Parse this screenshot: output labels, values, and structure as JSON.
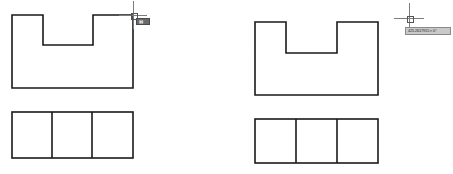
{
  "app": {
    "background_color": "#ffffff",
    "line_color": "#1a1a1a",
    "crosshair_color": "#7d7d7d"
  },
  "panels": [
    {
      "id": "left",
      "name": "left-drawing-panel",
      "front_view": {
        "name": "u-shaped-profile",
        "label": "U-shaped notched rectangle",
        "outline_points": "12,15 12,88 133,88 133,15 93,15 93,45 43,45 43,15",
        "bounds": {
          "x": 12,
          "y": 15,
          "width": 121,
          "height": 73
        },
        "notch": {
          "x": 43,
          "y": 15,
          "width": 50,
          "height": 30
        }
      },
      "top_view": {
        "name": "three-cell-rectangle",
        "label": "Rectangle divided into three cells",
        "bounds": {
          "x": 12,
          "y": 112,
          "width": 121,
          "height": 46
        },
        "dividers_x": [
          52,
          92
        ]
      },
      "cursor": {
        "name": "crosshair-cursor",
        "x": 133,
        "y": 15,
        "arm_length": 14,
        "pickbox_size": 5
      },
      "tooltip": {
        "name": "dynamic-input-tooltip",
        "style": "dark",
        "x": 136,
        "y": 18,
        "width": 14,
        "height": 7,
        "text": "▮▮"
      }
    },
    {
      "id": "right",
      "name": "right-drawing-panel",
      "front_view": {
        "name": "u-shaped-profile",
        "label": "U-shaped notched rectangle",
        "outline_points": "29,22 29,95 152,95 152,22 111,22 111,53 60,53 60,22",
        "bounds": {
          "x": 29,
          "y": 22,
          "width": 123,
          "height": 73
        },
        "notch": {
          "x": 60,
          "y": 22,
          "width": 51,
          "height": 31
        }
      },
      "top_view": {
        "name": "three-cell-rectangle",
        "label": "Rectangle divided into three cells",
        "bounds": {
          "x": 29,
          "y": 119,
          "width": 123,
          "height": 44
        },
        "dividers_x": [
          70,
          111
        ]
      },
      "cursor": {
        "name": "crosshair-cursor",
        "x": 183,
        "y": 18,
        "arm_length": 15,
        "pickbox_size": 5
      },
      "tooltip": {
        "name": "dynamic-input-tooltip",
        "style": "light",
        "x": 179,
        "y": 27,
        "width": 46,
        "height": 8,
        "text": "425.2617915 < 0°"
      }
    }
  ]
}
